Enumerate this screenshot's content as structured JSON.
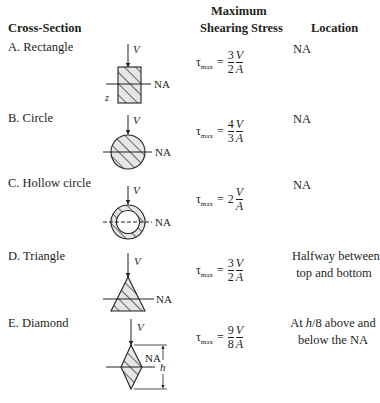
{
  "header": {
    "cross_section": "Cross-Section",
    "max_line1": "Maximum",
    "max_line2": "Shearing Stress",
    "location": "Location"
  },
  "symbols": {
    "tau": "τ",
    "max": "max",
    "equals": "=",
    "shear_force": "V",
    "area": "A",
    "neutral_axis": "NA",
    "z_axis": "z",
    "height": "h"
  },
  "rows": [
    {
      "label": "A. Rectangle",
      "shape": "rectangle",
      "coef_num": "3",
      "coef_den": "2",
      "coef_whole": "",
      "location": [
        "NA"
      ]
    },
    {
      "label": "B. Circle",
      "shape": "circle",
      "coef_num": "4",
      "coef_den": "3",
      "coef_whole": "",
      "location": [
        "NA"
      ]
    },
    {
      "label": "C. Hollow circle",
      "shape": "hollow-circle",
      "coef_num": "",
      "coef_den": "",
      "coef_whole": "2",
      "location": [
        "NA"
      ]
    },
    {
      "label": "D. Triangle",
      "shape": "triangle",
      "coef_num": "3",
      "coef_den": "2",
      "coef_whole": "",
      "location": [
        "Halfway between",
        "top and bottom"
      ]
    },
    {
      "label": "E. Diamond",
      "shape": "diamond",
      "coef_num": "9",
      "coef_den": "8",
      "coef_whole": "",
      "location": [
        "At h/8 above and",
        "below the NA"
      ]
    }
  ],
  "colors": {
    "ink": "#231f20",
    "hatch_fill": "#e6e6e6"
  }
}
